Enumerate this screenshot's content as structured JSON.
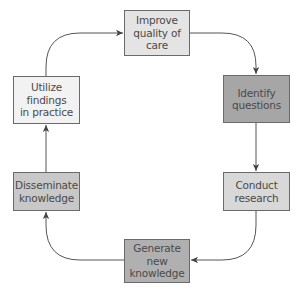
{
  "diagram": {
    "type": "cycle",
    "nodes": [
      {
        "id": "improve",
        "label": "Improve\nquality of\ncare",
        "fill": "#e4e4e4"
      },
      {
        "id": "identify",
        "label": "Identify\nquestions",
        "fill": "#a6a6a6"
      },
      {
        "id": "conduct",
        "label": "Conduct\nresearch",
        "fill": "#d8d8d8"
      },
      {
        "id": "generate",
        "label": "Generate\nnew\nknowledge",
        "fill": "#b0b0b0"
      },
      {
        "id": "disseminate",
        "label": "Disseminate\nknowledge",
        "fill": "#c8c8c8"
      },
      {
        "id": "utilize",
        "label": "Utilize\nfindings\nin practice",
        "fill": "#f2f2f2"
      }
    ],
    "edges": [
      {
        "from": "improve",
        "to": "identify"
      },
      {
        "from": "identify",
        "to": "conduct"
      },
      {
        "from": "conduct",
        "to": "generate"
      },
      {
        "from": "generate",
        "to": "disseminate"
      },
      {
        "from": "disseminate",
        "to": "utilize"
      },
      {
        "from": "utilize",
        "to": "improve"
      }
    ],
    "line_color": "#555555"
  }
}
